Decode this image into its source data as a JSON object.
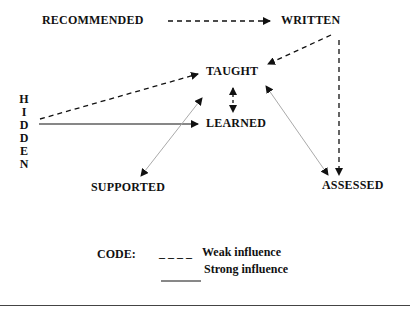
{
  "diagram": {
    "nodes": {
      "recommended": "RECOMMENDED",
      "written": "WRITTEN",
      "taught": "TAUGHT",
      "learned": "LEARNED",
      "supported": "SUPPORTED",
      "assessed": "ASSESSED",
      "hidden_letters": [
        "H",
        "I",
        "D",
        "D",
        "E",
        "N"
      ]
    },
    "edges": [
      {
        "from": "RECOMMENDED",
        "to": "WRITTEN",
        "type": "weak"
      },
      {
        "from": "WRITTEN",
        "to": "TAUGHT",
        "type": "weak"
      },
      {
        "from": "WRITTEN",
        "to": "ASSESSED",
        "type": "weak"
      },
      {
        "from": "HIDDEN",
        "to": "TAUGHT",
        "type": "weak"
      },
      {
        "from": "HIDDEN",
        "to": "LEARNED",
        "type": "strong"
      },
      {
        "from": "TAUGHT",
        "to": "LEARNED",
        "type": "weak",
        "bidirectional": true
      },
      {
        "from": "TAUGHT",
        "to": "SUPPORTED",
        "type": "strong",
        "bidirectional": true
      },
      {
        "from": "TAUGHT",
        "to": "ASSESSED",
        "type": "strong",
        "bidirectional": true
      }
    ]
  },
  "legend": {
    "title": "CODE:",
    "weak_symbol": "_ _ _ _",
    "weak_label": "Weak influence",
    "strong_label": "Strong influence"
  }
}
